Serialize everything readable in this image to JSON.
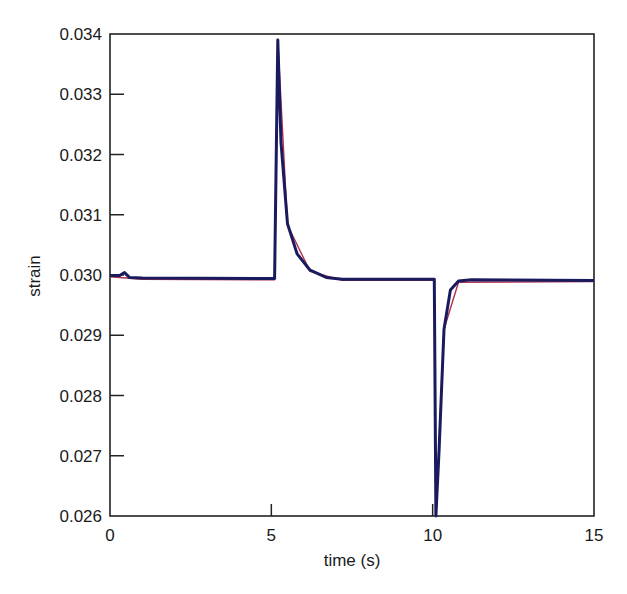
{
  "chart_data": {
    "type": "line",
    "title": "",
    "xlabel": "time (s)",
    "ylabel": "strain",
    "xlim": [
      0,
      15
    ],
    "ylim": [
      0.026,
      0.034
    ],
    "x_ticks": [
      "0",
      "5",
      "10",
      "15"
    ],
    "y_ticks": [
      "0.026",
      "0.027",
      "0.028",
      "0.029",
      "0.030",
      "0.031",
      "0.032",
      "0.033",
      "0.034"
    ],
    "grid": false,
    "legend": null,
    "series": [
      {
        "name": "strain (blue)",
        "color": "#1a1a5e",
        "points": [
          [
            0.0,
            0.02999
          ],
          [
            0.3,
            0.02999
          ],
          [
            0.45,
            0.03004
          ],
          [
            0.6,
            0.02996
          ],
          [
            1.0,
            0.02995
          ],
          [
            5.0,
            0.02994
          ],
          [
            5.1,
            0.02994
          ],
          [
            5.2,
            0.0339
          ],
          [
            5.3,
            0.0322
          ],
          [
            5.5,
            0.03085
          ],
          [
            5.8,
            0.03035
          ],
          [
            6.2,
            0.03008
          ],
          [
            6.7,
            0.02996
          ],
          [
            7.2,
            0.02993
          ],
          [
            10.0,
            0.02993
          ],
          [
            10.05,
            0.02993
          ],
          [
            10.1,
            0.026
          ],
          [
            10.2,
            0.0271
          ],
          [
            10.35,
            0.0291
          ],
          [
            10.55,
            0.02975
          ],
          [
            10.8,
            0.0299
          ],
          [
            11.2,
            0.02992
          ],
          [
            15.0,
            0.02991
          ]
        ]
      },
      {
        "name": "strain (red)",
        "color": "#b03050",
        "points": [
          [
            0.0,
            0.02997
          ],
          [
            1.0,
            0.02993
          ],
          [
            5.1,
            0.02992
          ],
          [
            5.2,
            0.0339
          ],
          [
            5.5,
            0.03083
          ],
          [
            6.2,
            0.03006
          ],
          [
            7.2,
            0.02991
          ],
          [
            10.05,
            0.02991
          ],
          [
            10.1,
            0.026
          ],
          [
            10.35,
            0.0291
          ],
          [
            10.8,
            0.02988
          ],
          [
            15.0,
            0.02989
          ]
        ]
      }
    ]
  }
}
